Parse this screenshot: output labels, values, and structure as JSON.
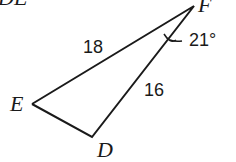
{
  "header": {
    "partial_text": "DE"
  },
  "triangle": {
    "vertices": {
      "E": {
        "label": "E",
        "x": 32,
        "y": 104
      },
      "D": {
        "label": "D",
        "x": 92,
        "y": 137
      },
      "F": {
        "label": "F",
        "x": 194,
        "y": 6
      }
    },
    "sides": {
      "EF": {
        "label": "18"
      },
      "DF": {
        "label": "16"
      }
    },
    "angle_F": {
      "label": "21°"
    }
  },
  "colors": {
    "stroke": "#1a1a1a",
    "text": "#1a1a1a",
    "background": "#ffffff"
  }
}
